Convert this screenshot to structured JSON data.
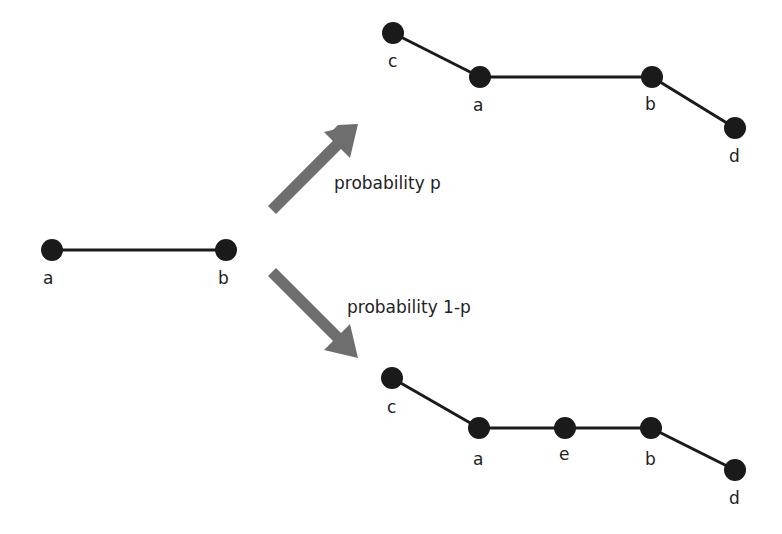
{
  "diagram": {
    "type": "graph-transformation",
    "colors": {
      "node": "#1a1a1a",
      "edge": "#1a1a1a",
      "arrow": "#6e6e6e",
      "text": "#222222"
    },
    "original": {
      "nodes": [
        {
          "id": "a",
          "label": "a",
          "x": 52,
          "y": 250
        },
        {
          "id": "b",
          "label": "b",
          "x": 226,
          "y": 250
        }
      ],
      "edges": [
        [
          "a",
          "b"
        ]
      ]
    },
    "top_branch": {
      "probability_label": "probability p",
      "nodes": [
        {
          "id": "c",
          "label": "c",
          "x": 393,
          "y": 33
        },
        {
          "id": "a",
          "label": "a",
          "x": 480,
          "y": 77
        },
        {
          "id": "b",
          "label": "b",
          "x": 652,
          "y": 77
        },
        {
          "id": "d",
          "label": "d",
          "x": 735,
          "y": 128
        }
      ],
      "edges": [
        [
          "c",
          "a"
        ],
        [
          "a",
          "b"
        ],
        [
          "b",
          "d"
        ]
      ]
    },
    "bottom_branch": {
      "probability_label": "probability 1-p",
      "nodes": [
        {
          "id": "c",
          "label": "c",
          "x": 392,
          "y": 378
        },
        {
          "id": "a",
          "label": "a",
          "x": 479,
          "y": 428
        },
        {
          "id": "e",
          "label": "e",
          "x": 565,
          "y": 428
        },
        {
          "id": "b",
          "label": "b",
          "x": 651,
          "y": 428
        },
        {
          "id": "d",
          "label": "d",
          "x": 735,
          "y": 470
        }
      ],
      "edges": [
        [
          "c",
          "a"
        ],
        [
          "a",
          "e"
        ],
        [
          "e",
          "b"
        ],
        [
          "b",
          "d"
        ]
      ]
    }
  }
}
